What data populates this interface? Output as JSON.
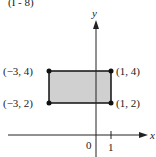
{
  "header": {
    "fragment": "(I - 8)"
  },
  "diagram": {
    "type": "coordinate-plane-rectangle",
    "axes": {
      "x_label": "x",
      "y_label": "y",
      "origin_label": "0",
      "tick_label": "1"
    },
    "fill_color": "#d0d0d0",
    "stroke_color": "#111111",
    "vertices": [
      {
        "label": "(−3, 4)",
        "x": -3,
        "y": 4
      },
      {
        "label": "(1, 4)",
        "x": 1,
        "y": 4
      },
      {
        "label": "(−3, 2)",
        "x": -3,
        "y": 2
      },
      {
        "label": "(1, 2)",
        "x": 1,
        "y": 2
      }
    ]
  }
}
